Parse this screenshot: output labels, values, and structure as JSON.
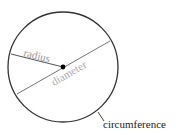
{
  "diagram": {
    "labels": {
      "radius": "radius",
      "diameter": "diameter",
      "circumference": "circumference"
    },
    "colors": {
      "circle_stroke": "#333333",
      "line_stroke": "#555555",
      "inner_label": "#999999",
      "outer_label": "#222222",
      "center_dot": "#000000"
    },
    "geometry": {
      "center": [
        63,
        67
      ],
      "radius": 55
    }
  }
}
